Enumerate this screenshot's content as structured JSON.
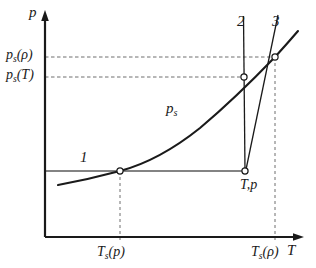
{
  "figure": {
    "type": "diagram",
    "kind": "p-T saturation (phase) diagram",
    "background_color": "#ffffff",
    "line_color": "#1a1a1a",
    "guide_color": "#6e6e6e"
  },
  "axes": {
    "y_label": "p",
    "x_label": "T",
    "origin_px": [
      45,
      237
    ],
    "x_end_px": [
      302,
      237
    ],
    "y_top_px": [
      45,
      12
    ]
  },
  "curve": {
    "label": "p",
    "label_sub": "s",
    "description": "saturation pressure curve rising left to right"
  },
  "lines": [
    {
      "id": "2",
      "label": "2",
      "type": "vertical isotherm",
      "x_px": 245
    },
    {
      "id": "3",
      "label": "3",
      "type": "steep rising line",
      "from_px": [
        245,
        171
      ],
      "to_px": [
        277,
        18
      ]
    }
  ],
  "points": [
    {
      "id": "1",
      "label": "1",
      "marker": "open-circle",
      "x_px": 120,
      "y_px": 171
    },
    {
      "id": "2",
      "label": "2",
      "marker": "open-circle",
      "x_px": 245,
      "y_px": 77
    },
    {
      "id": "3",
      "label": "3",
      "marker": "open-circle",
      "x_px": 275,
      "y_px": 57
    },
    {
      "id": "Tp",
      "label": "T,p",
      "marker": "open-circle",
      "x_px": 245,
      "y_px": 171
    }
  ],
  "tick_labels": {
    "y_upper": {
      "base": "p",
      "sub": "s",
      "arg": "(ρ)",
      "y_px": 57
    },
    "y_lower": {
      "base": "p",
      "sub": "s",
      "arg": "(T)",
      "y_px": 77
    },
    "x_left": {
      "base": "T",
      "sub": "s",
      "arg": "(p)",
      "x_px": 120
    },
    "x_right": {
      "base": "T",
      "sub": "s",
      "arg": "(ρ)",
      "x_px": 275
    }
  },
  "annotations": {
    "state_point": "T,p"
  }
}
